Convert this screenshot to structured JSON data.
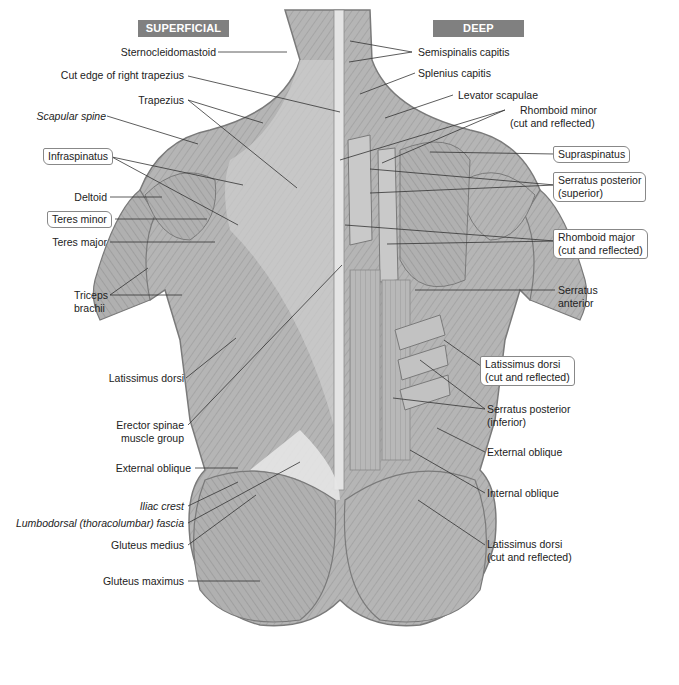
{
  "headers": {
    "superficial": "SUPERFICIAL",
    "deep": "DEEP"
  },
  "colors": {
    "header_bg": "#808080",
    "header_text": "#ffffff",
    "muscle_fill": "#b8b8b8",
    "muscle_dark": "#8e8e8e",
    "fascia": "#e8e8e8",
    "leader_line": "#333333"
  },
  "left_labels": [
    {
      "id": "sternocleidomastoid",
      "text": "Sternocleidomastoid",
      "italic": false,
      "boxed": false
    },
    {
      "id": "cut-edge-right-trapezius",
      "text": "Cut edge of right trapezius",
      "italic": false,
      "boxed": false
    },
    {
      "id": "trapezius",
      "text": "Trapezius",
      "italic": false,
      "boxed": false
    },
    {
      "id": "scapular-spine",
      "text": "Scapular spine",
      "italic": true,
      "boxed": false
    },
    {
      "id": "infraspinatus",
      "text": "Infraspinatus",
      "italic": false,
      "boxed": true
    },
    {
      "id": "deltoid",
      "text": "Deltoid",
      "italic": false,
      "boxed": false
    },
    {
      "id": "teres-minor",
      "text": "Teres minor",
      "italic": false,
      "boxed": true
    },
    {
      "id": "teres-major",
      "text": "Teres major",
      "italic": false,
      "boxed": false
    },
    {
      "id": "triceps-brachii",
      "text": "Triceps",
      "text2": "brachii",
      "italic": false,
      "boxed": false
    },
    {
      "id": "latissimus-dorsi",
      "text": "Latissimus dorsi",
      "italic": false,
      "boxed": false
    },
    {
      "id": "erector-spinae",
      "text": "Erector spinae",
      "text2": "muscle group",
      "italic": false,
      "boxed": false
    },
    {
      "id": "external-oblique-left",
      "text": "External oblique",
      "italic": false,
      "boxed": false
    },
    {
      "id": "iliac-crest",
      "text": "Iliac crest",
      "italic": true,
      "boxed": false
    },
    {
      "id": "lumbodorsal-fascia",
      "text": "Lumbodorsal (thoracolumbar) fascia",
      "italic": true,
      "boxed": false
    },
    {
      "id": "gluteus-medius",
      "text": "Gluteus medius",
      "italic": false,
      "boxed": false
    },
    {
      "id": "gluteus-maximus",
      "text": "Gluteus maximus",
      "italic": false,
      "boxed": false
    }
  ],
  "right_labels": [
    {
      "id": "semispinalis-capitis",
      "text": "Semispinalis capitis",
      "boxed": false
    },
    {
      "id": "splenius-capitis",
      "text": "Splenius capitis",
      "boxed": false
    },
    {
      "id": "levator-scapulae",
      "text": "Levator scapulae",
      "boxed": false
    },
    {
      "id": "rhomboid-minor",
      "text": "Rhomboid minor",
      "text2": "(cut and reflected)",
      "boxed": false
    },
    {
      "id": "supraspinatus",
      "text": "Supraspinatus",
      "boxed": true
    },
    {
      "id": "serratus-posterior-superior",
      "text": "Serratus posterior",
      "text2": "(superior)",
      "boxed": true
    },
    {
      "id": "rhomboid-major",
      "text": "Rhomboid major",
      "text2": "(cut and reflected)",
      "boxed": true
    },
    {
      "id": "serratus-anterior",
      "text": "Serratus",
      "text2": "anterior",
      "boxed": false
    },
    {
      "id": "latissimus-dorsi-cut-1",
      "text": "Latissimus dorsi",
      "text2": "(cut and reflected)",
      "boxed": true
    },
    {
      "id": "serratus-posterior-inferior",
      "text": "Serratus posterior",
      "text2": "(inferior)",
      "boxed": false
    },
    {
      "id": "external-oblique-right",
      "text": "External oblique",
      "boxed": false
    },
    {
      "id": "internal-oblique",
      "text": "Internal oblique",
      "boxed": false
    },
    {
      "id": "latissimus-dorsi-cut-2",
      "text": "Latissimus dorsi",
      "text2": "(cut and reflected)",
      "boxed": false
    }
  ]
}
